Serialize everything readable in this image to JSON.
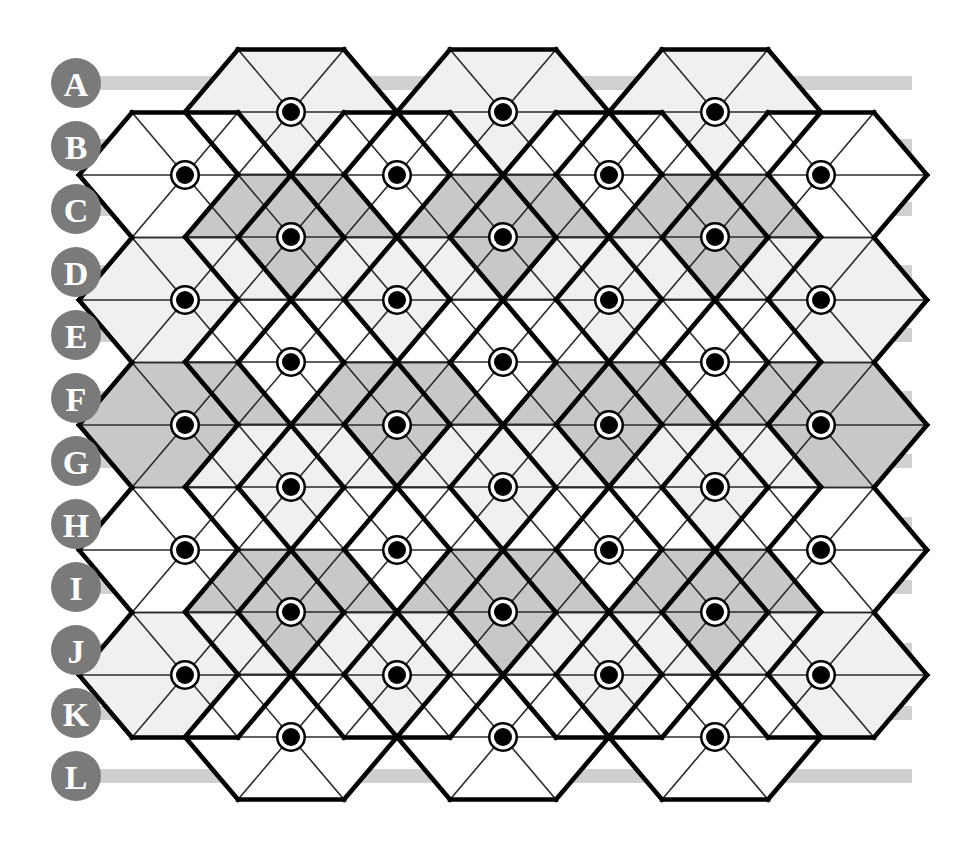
{
  "figure": {
    "canvas": {
      "width": 955,
      "height": 852,
      "background": "#ffffff"
    }
  },
  "palette": {
    "band": "#d0d0d0",
    "label_circle": "#7a7a7a",
    "label_text": "#ffffff",
    "hex_white": "#ffffff",
    "hex_light": "#f0f0f0",
    "hex_medium": "#c8c8c8",
    "thin_line": "#2a2a2a",
    "outline": "#000000",
    "dot_fill": "#000000",
    "dot_ring": "#ffffff"
  },
  "row_labels": [
    {
      "id": "A",
      "label": "A",
      "cy": 83,
      "band": true
    },
    {
      "id": "B",
      "label": "B",
      "cy": 146,
      "band": true
    },
    {
      "id": "C",
      "label": "C",
      "cy": 209,
      "band": true
    },
    {
      "id": "D",
      "label": "D",
      "cy": 272,
      "band": true
    },
    {
      "id": "E",
      "label": "E",
      "cy": 335,
      "band": true
    },
    {
      "id": "F",
      "label": "F",
      "cy": 398,
      "band": true
    },
    {
      "id": "G",
      "label": "G",
      "cy": 461,
      "band": true
    },
    {
      "id": "H",
      "label": "H",
      "cy": 524,
      "band": true
    },
    {
      "id": "I",
      "label": "I",
      "cy": 587,
      "band": true
    },
    {
      "id": "J",
      "label": "J",
      "cy": 650,
      "band": true
    },
    {
      "id": "K",
      "label": "K",
      "cy": 713,
      "band": true
    },
    {
      "id": "L",
      "label": "L",
      "cy": 776,
      "band": true
    }
  ],
  "label_geometry": {
    "circle_cx": 76,
    "circle_r": 25,
    "band_x": 90,
    "band_width": 822,
    "band_height": 14
  },
  "lattice": {
    "dx": 212,
    "dy": 125,
    "hex_radius": 106,
    "origin_x": 185,
    "origin_y": 112,
    "dot_outer_r": 15,
    "dot_ring_r": 12.5,
    "dot_inner_r": 9,
    "columns_even": [
      185,
      397,
      609,
      821
    ],
    "columns_odd": [
      291,
      503,
      715
    ],
    "rows_even_y": [
      175,
      300,
      425,
      550,
      675
    ],
    "rows_odd_y": [
      112,
      237,
      362,
      487,
      612,
      737
    ],
    "shade_codes": {
      "0": "#ffffff",
      "1": "#f0f0f0",
      "2": "#c8c8c8"
    }
  },
  "cells": [
    {
      "row": 0,
      "col": 0,
      "cx": 291,
      "cy": 112,
      "shade": 1
    },
    {
      "row": 0,
      "col": 1,
      "cx": 503,
      "cy": 112,
      "shade": 1
    },
    {
      "row": 0,
      "col": 2,
      "cx": 715,
      "cy": 112,
      "shade": 1
    },
    {
      "row": 1,
      "col": 0,
      "cx": 185,
      "cy": 175,
      "shade": 0
    },
    {
      "row": 1,
      "col": 1,
      "cx": 397,
      "cy": 175,
      "shade": 0
    },
    {
      "row": 1,
      "col": 2,
      "cx": 609,
      "cy": 175,
      "shade": 0
    },
    {
      "row": 1,
      "col": 3,
      "cx": 821,
      "cy": 175,
      "shade": 0
    },
    {
      "row": 2,
      "col": 0,
      "cx": 291,
      "cy": 237,
      "shade": 2
    },
    {
      "row": 2,
      "col": 1,
      "cx": 503,
      "cy": 237,
      "shade": 2
    },
    {
      "row": 2,
      "col": 2,
      "cx": 715,
      "cy": 237,
      "shade": 2
    },
    {
      "row": 3,
      "col": 0,
      "cx": 185,
      "cy": 300,
      "shade": 1
    },
    {
      "row": 3,
      "col": 1,
      "cx": 397,
      "cy": 300,
      "shade": 1
    },
    {
      "row": 3,
      "col": 2,
      "cx": 609,
      "cy": 300,
      "shade": 1
    },
    {
      "row": 3,
      "col": 3,
      "cx": 821,
      "cy": 300,
      "shade": 1
    },
    {
      "row": 4,
      "col": 0,
      "cx": 291,
      "cy": 362,
      "shade": 0
    },
    {
      "row": 4,
      "col": 1,
      "cx": 503,
      "cy": 362,
      "shade": 0
    },
    {
      "row": 4,
      "col": 2,
      "cx": 715,
      "cy": 362,
      "shade": 0
    },
    {
      "row": 5,
      "col": 0,
      "cx": 185,
      "cy": 425,
      "shade": 2
    },
    {
      "row": 5,
      "col": 1,
      "cx": 397,
      "cy": 425,
      "shade": 2
    },
    {
      "row": 5,
      "col": 2,
      "cx": 609,
      "cy": 425,
      "shade": 2
    },
    {
      "row": 5,
      "col": 3,
      "cx": 821,
      "cy": 425,
      "shade": 2
    },
    {
      "row": 6,
      "col": 0,
      "cx": 291,
      "cy": 487,
      "shade": 1
    },
    {
      "row": 6,
      "col": 1,
      "cx": 503,
      "cy": 487,
      "shade": 1
    },
    {
      "row": 6,
      "col": 2,
      "cx": 715,
      "cy": 487,
      "shade": 1
    },
    {
      "row": 7,
      "col": 0,
      "cx": 185,
      "cy": 550,
      "shade": 0
    },
    {
      "row": 7,
      "col": 1,
      "cx": 397,
      "cy": 550,
      "shade": 0
    },
    {
      "row": 7,
      "col": 2,
      "cx": 609,
      "cy": 550,
      "shade": 0
    },
    {
      "row": 7,
      "col": 3,
      "cx": 821,
      "cy": 550,
      "shade": 0
    },
    {
      "row": 8,
      "col": 0,
      "cx": 291,
      "cy": 612,
      "shade": 2
    },
    {
      "row": 8,
      "col": 1,
      "cx": 503,
      "cy": 612,
      "shade": 2
    },
    {
      "row": 8,
      "col": 2,
      "cx": 715,
      "cy": 612,
      "shade": 2
    },
    {
      "row": 9,
      "col": 0,
      "cx": 185,
      "cy": 675,
      "shade": 1
    },
    {
      "row": 9,
      "col": 1,
      "cx": 397,
      "cy": 675,
      "shade": 1
    },
    {
      "row": 9,
      "col": 2,
      "cx": 609,
      "cy": 675,
      "shade": 1
    },
    {
      "row": 9,
      "col": 3,
      "cx": 821,
      "cy": 675,
      "shade": 1
    },
    {
      "row": 10,
      "col": 0,
      "cx": 291,
      "cy": 737,
      "shade": 0
    },
    {
      "row": 10,
      "col": 1,
      "cx": 503,
      "cy": 737,
      "shade": 0
    },
    {
      "row": 10,
      "col": 2,
      "cx": 715,
      "cy": 737,
      "shade": 0
    }
  ],
  "counts": {
    "rows": 12,
    "hexagons": 37,
    "dots": 37
  }
}
